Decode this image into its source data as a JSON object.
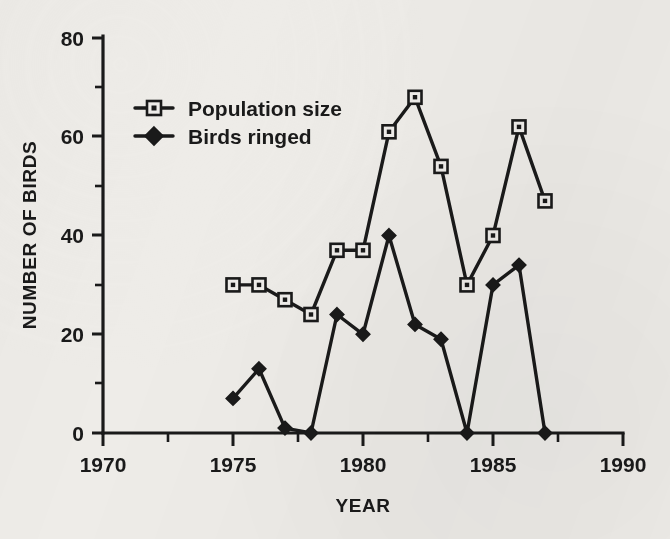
{
  "chart_data": {
    "type": "line",
    "title": "",
    "xlabel": "YEAR",
    "ylabel": "NUMBER OF BIRDS",
    "xlim": [
      1970,
      1990
    ],
    "ylim": [
      0,
      80
    ],
    "xticks": [
      1970,
      1975,
      1980,
      1985,
      1990
    ],
    "xtick_labels": [
      "1970",
      "1975",
      "1980",
      "1985",
      "1990"
    ],
    "xminor_ticks": [
      1972.5,
      1977.5,
      1982.5,
      1987.5
    ],
    "yticks": [
      0,
      20,
      40,
      60,
      80
    ],
    "ytick_labels": [
      "0",
      "20",
      "40",
      "60",
      "80"
    ],
    "yminor_ticks": [
      10,
      30,
      50,
      70
    ],
    "grid": false,
    "legend_position": "upper-left-inside",
    "x": [
      1975,
      1976,
      1977,
      1978,
      1979,
      1980,
      1981,
      1982,
      1983,
      1984,
      1985,
      1986,
      1987
    ],
    "series": [
      {
        "name": "Population size",
        "marker": "open-square",
        "values": [
          30,
          30,
          27,
          24,
          37,
          37,
          61,
          68,
          54,
          30,
          40,
          62,
          47
        ]
      },
      {
        "name": "Birds ringed",
        "marker": "filled-diamond",
        "values": [
          7,
          13,
          1,
          0,
          24,
          20,
          40,
          22,
          19,
          0,
          30,
          34,
          0
        ]
      }
    ],
    "colors": {
      "ink": "#1a1a1a",
      "background": "#eeece8"
    }
  },
  "legend": {
    "entries": [
      {
        "label": "Population size",
        "marker": "open-square-icon"
      },
      {
        "label": "Birds ringed",
        "marker": "filled-diamond-icon"
      }
    ]
  },
  "axes": {
    "y_title": "NUMBER OF BIRDS",
    "x_title": "YEAR"
  }
}
